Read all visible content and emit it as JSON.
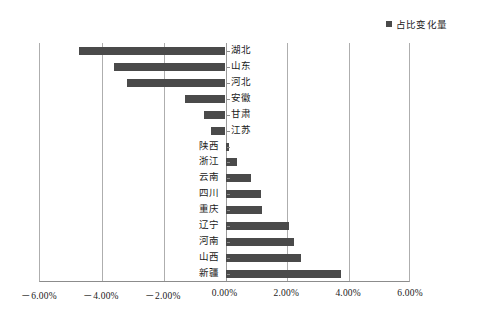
{
  "legend": {
    "marker": "square-marker-icon",
    "label": "占比变化量",
    "color": "#4a4a4a"
  },
  "axis": {
    "tick_labels": [
      "－6.00%",
      "－4.00%",
      "－2.00%",
      "0.00%",
      "2.00%",
      "4.00%",
      "6.00%"
    ],
    "tick_values": [
      -6,
      -4,
      -2,
      0,
      2,
      4,
      6
    ],
    "min": -6,
    "max": 6
  },
  "chart_data": {
    "type": "bar",
    "orientation": "horizontal",
    "title": "",
    "xlabel": "",
    "ylabel": "",
    "xlim": [
      -6,
      6
    ],
    "grid": true,
    "legend_position": "top-right",
    "units": "percent",
    "categories": [
      "湖北",
      "山东",
      "河北",
      "安徽",
      "甘肃",
      "江苏",
      "陕西",
      "浙江",
      "云南",
      "四川",
      "重庆",
      "辽宁",
      "河南",
      "山西",
      "新疆"
    ],
    "series": [
      {
        "name": "占比变化量",
        "color": "#4a4a4a",
        "values": [
          -4.75,
          -3.6,
          -3.2,
          -1.3,
          -0.7,
          -0.48,
          0.12,
          0.38,
          0.82,
          1.15,
          1.17,
          2.05,
          2.2,
          2.45,
          3.75
        ]
      }
    ]
  }
}
